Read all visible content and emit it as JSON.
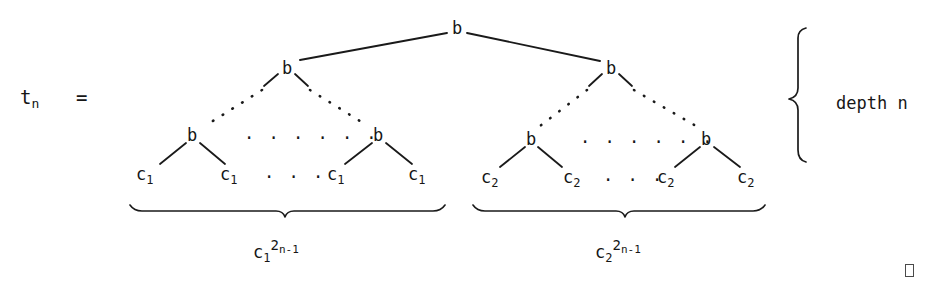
{
  "figure": {
    "kind": "binary-tree-diagram",
    "equation_label": "t",
    "equation_subscript": "n",
    "equation_sign": "=",
    "root": {
      "label": "b"
    },
    "level2": [
      {
        "label": "b"
      },
      {
        "label": "b"
      }
    ],
    "level3": [
      {
        "label": "b"
      },
      {
        "label": "b"
      },
      {
        "label": "b"
      },
      {
        "label": "b"
      }
    ],
    "leaves_left": [
      {
        "base": "c",
        "sub": "1"
      },
      {
        "base": "c",
        "sub": "1"
      },
      {
        "base": "c",
        "sub": "1"
      },
      {
        "base": "c",
        "sub": "1"
      }
    ],
    "leaves_right": [
      {
        "base": "c",
        "sub": "2"
      },
      {
        "base": "c",
        "sub": "2"
      },
      {
        "base": "c",
        "sub": "2"
      },
      {
        "base": "c",
        "sub": "2"
      }
    ],
    "ellipsis_level3_left": "· · · · · ·",
    "ellipsis_level3_right": "· · · · · ·",
    "ellipsis_leaves_left": "· · ·",
    "ellipsis_leaves_right": "· · ·",
    "brace_left_label": {
      "base": "c",
      "sub": "1",
      "sup_base": "2",
      "sup_exp": "n-1"
    },
    "brace_right_label": {
      "base": "c",
      "sub": "2",
      "sup_base": "2",
      "sup_exp": "n-1"
    },
    "depth_label": "depth n",
    "qed": "□",
    "colors": {
      "ink": "#161616",
      "background": "#ffffff",
      "qed_border": "#4a4a4a"
    }
  }
}
